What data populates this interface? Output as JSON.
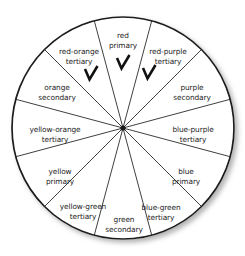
{
  "figure": {
    "center": {
      "x": 123,
      "y": 128
    },
    "radius": 111,
    "segment_count": 12,
    "colors": {
      "outline": "#1a1a1a",
      "spoke": "#2a2a2a",
      "background": "#ffffff",
      "text": "#1d1d1d",
      "checkmark": "#111111",
      "shadow": "#b9b9b9"
    }
  },
  "segments": [
    {
      "id": "red",
      "line1": "red",
      "line2": "primary",
      "category": "primary",
      "angle_center_deg": 0,
      "label_x": 123,
      "label_y": 36,
      "checked": true
    },
    {
      "id": "red-purple",
      "line1": "red-purple",
      "line2": "tertiary",
      "category": "tertiary",
      "angle_center_deg": 30,
      "label_x": 168,
      "label_y": 52,
      "checked": true
    },
    {
      "id": "purple",
      "line1": "purple",
      "line2": "secondary",
      "category": "secondary",
      "angle_center_deg": 60,
      "label_x": 192,
      "label_y": 88,
      "checked": false
    },
    {
      "id": "blue-purple",
      "line1": "blue-purple",
      "line2": "tertiary",
      "category": "tertiary",
      "angle_center_deg": 90,
      "label_x": 193,
      "label_y": 130,
      "checked": false
    },
    {
      "id": "blue",
      "line1": "blue",
      "line2": "primary",
      "category": "primary",
      "angle_center_deg": 120,
      "label_x": 186,
      "label_y": 172,
      "checked": false
    },
    {
      "id": "blue-green",
      "line1": "blue-green",
      "line2": "tertiary",
      "category": "tertiary",
      "angle_center_deg": 150,
      "label_x": 161,
      "label_y": 208,
      "checked": false
    },
    {
      "id": "green",
      "line1": "green",
      "line2": "secondary",
      "category": "secondary",
      "angle_center_deg": 180,
      "label_x": 124,
      "label_y": 220,
      "checked": false
    },
    {
      "id": "yellow-green",
      "line1": "yellow-green",
      "line2": "tertiary",
      "category": "tertiary",
      "angle_center_deg": 210,
      "label_x": 83,
      "label_y": 207,
      "checked": false
    },
    {
      "id": "yellow",
      "line1": "yellow",
      "line2": "primary",
      "category": "primary",
      "angle_center_deg": 240,
      "label_x": 60,
      "label_y": 172,
      "checked": false
    },
    {
      "id": "yellow-orange",
      "line1": "yellow-orange",
      "line2": "tertiary",
      "category": "tertiary",
      "angle_center_deg": 270,
      "label_x": 55,
      "label_y": 130,
      "checked": false
    },
    {
      "id": "orange",
      "line1": "orange",
      "line2": "secondary",
      "category": "secondary",
      "angle_center_deg": 300,
      "label_x": 57,
      "label_y": 88,
      "checked": false
    },
    {
      "id": "red-orange",
      "line1": "red-orange",
      "line2": "tertiary",
      "category": "tertiary",
      "angle_center_deg": 330,
      "label_x": 79,
      "label_y": 52,
      "checked": false
    }
  ],
  "checkmarks": [
    {
      "id": "check-red-orange",
      "x": 91,
      "y": 74
    },
    {
      "id": "check-red",
      "x": 123,
      "y": 63
    },
    {
      "id": "check-red-purple",
      "x": 149,
      "y": 73
    }
  ]
}
